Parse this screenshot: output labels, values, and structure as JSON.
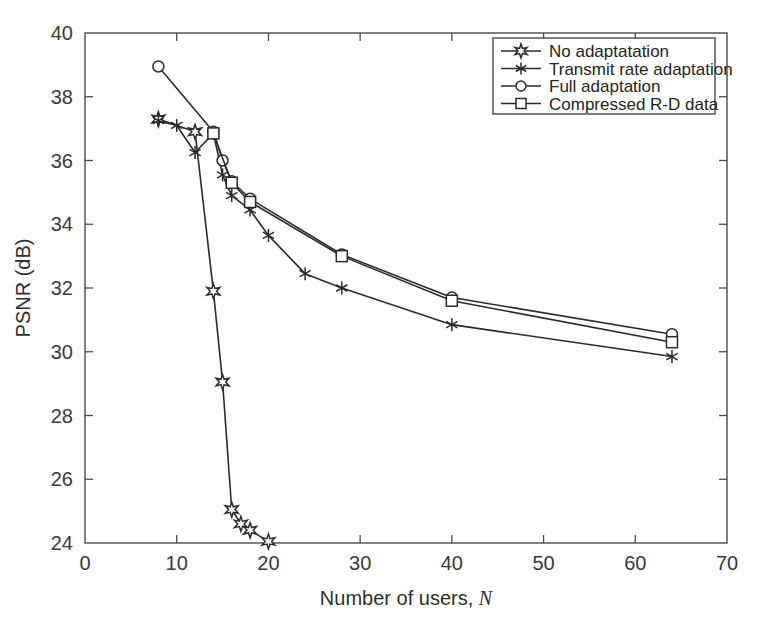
{
  "chart_data": {
    "type": "line",
    "title": "",
    "xlabel": "Number of users, N",
    "xlabel_plain": "Number of users,",
    "xlabel_italic": "N",
    "ylabel": "PSNR (dB)",
    "xlim": [
      0,
      70
    ],
    "ylim": [
      24,
      40
    ],
    "xticks": [
      0,
      10,
      20,
      30,
      40,
      50,
      60,
      70
    ],
    "yticks": [
      24,
      26,
      28,
      30,
      32,
      34,
      36,
      38,
      40
    ],
    "grid": false,
    "legend_position": "top-right",
    "line_color": "#2b2b2b",
    "axis_color": "#4a4a4a",
    "background": "#ffffff",
    "series": [
      {
        "name": "No adaptatation",
        "marker": "hexagram-star",
        "marker_fill": "open",
        "x": [
          8,
          12,
          14,
          15,
          16,
          17,
          18,
          20
        ],
        "y": [
          37.3,
          36.9,
          31.9,
          29.05,
          25.05,
          24.6,
          24.4,
          24.05
        ]
      },
      {
        "name": "Transmit rate adaptation",
        "marker": "asterisk",
        "marker_fill": "solid",
        "x": [
          8,
          10,
          12,
          14,
          15,
          16,
          18,
          20,
          24,
          28,
          40,
          64
        ],
        "y": [
          37.25,
          37.1,
          36.25,
          36.85,
          35.55,
          34.9,
          34.45,
          33.65,
          32.45,
          32.0,
          30.85,
          29.85
        ]
      },
      {
        "name": "Full adaptation",
        "marker": "circle",
        "marker_fill": "open",
        "x": [
          8,
          14,
          15,
          16,
          18,
          28,
          40,
          64
        ],
        "y": [
          38.95,
          36.9,
          36.0,
          35.35,
          34.8,
          33.05,
          31.7,
          30.55
        ]
      },
      {
        "name": "Compressed R-D data",
        "marker": "square",
        "marker_fill": "open",
        "x": [
          14,
          16,
          18,
          28,
          40,
          64
        ],
        "y": [
          36.85,
          35.3,
          34.7,
          33.0,
          31.6,
          30.3
        ]
      }
    ]
  },
  "legend": {
    "entries": [
      {
        "label": "No adaptatation",
        "marker": "hexagram-star"
      },
      {
        "label": "Transmit rate adaptation",
        "marker": "asterisk"
      },
      {
        "label": "Full adaptation",
        "marker": "circle"
      },
      {
        "label": "Compressed R-D data",
        "marker": "square"
      }
    ]
  }
}
